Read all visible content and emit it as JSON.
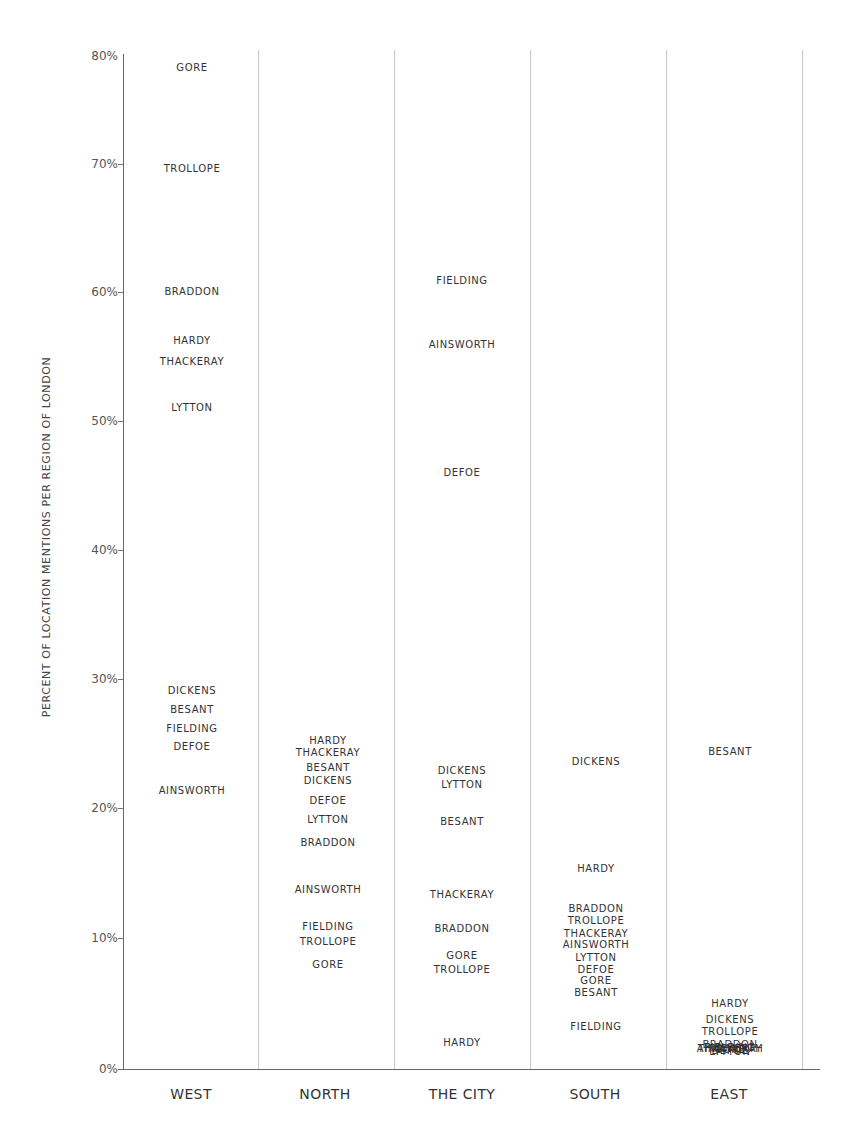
{
  "chart_data": {
    "type": "scatter",
    "title": "",
    "xlabel": "",
    "ylabel": "PERCENT OF LOCATION MENTIONS PER REGION OF LONDON",
    "ylim": [
      0,
      80
    ],
    "yticks": [
      "0%",
      "10%",
      "20%",
      "30%",
      "40%",
      "50%",
      "60%",
      "70%",
      "80%"
    ],
    "grid": "vertical column separators",
    "legend": "none (points are labeled with author names)",
    "categories": [
      "WEST",
      "NORTH",
      "THE CITY",
      "SOUTH",
      "EAST"
    ],
    "series": [
      {
        "name": "GORE",
        "values": [
          77.6,
          8.1,
          8.8,
          6.8,
          1.5
        ]
      },
      {
        "name": "TROLLOPE",
        "values": [
          69.8,
          9.8,
          7.7,
          11.5,
          2.9
        ]
      },
      {
        "name": "BRADDON",
        "values": [
          60.2,
          17.5,
          10.9,
          12.4,
          1.8
        ]
      },
      {
        "name": "HARDY",
        "values": [
          56.4,
          25.4,
          2.0,
          15.5,
          5.0
        ]
      },
      {
        "name": "THACKERAY",
        "values": [
          54.8,
          24.5,
          13.5,
          10.5,
          1.5
        ]
      },
      {
        "name": "LYTTON",
        "values": [
          51.2,
          19.3,
          22.0,
          8.6,
          1.3
        ]
      },
      {
        "name": "DICKENS",
        "values": [
          29.3,
          22.3,
          23.1,
          23.8,
          3.8
        ]
      },
      {
        "name": "BESANT",
        "values": [
          27.8,
          23.3,
          19.1,
          5.9,
          24.6
        ]
      },
      {
        "name": "FIELDING",
        "values": [
          26.4,
          11.0,
          61.1,
          3.3,
          1.6
        ]
      },
      {
        "name": "DEFOE",
        "values": [
          25.0,
          20.8,
          46.2,
          7.7,
          1.4
        ]
      },
      {
        "name": "AINSWORTH",
        "values": [
          21.6,
          13.9,
          56.1,
          9.6,
          1.5
        ]
      }
    ]
  },
  "axis": {
    "ylabel": "PERCENT OF LOCATION MENTIONS PER REGION OF LONDON",
    "yticks": [
      "0%",
      "10%",
      "20%",
      "30%",
      "40%",
      "50%",
      "60%",
      "70%",
      "80%"
    ],
    "categories": [
      "WEST",
      "NORTH",
      "THE CITY",
      "SOUTH",
      "EAST"
    ]
  },
  "labels": {
    "west": [
      {
        "name": "GORE",
        "y": 68
      },
      {
        "name": "TROLLOPE",
        "y": 169
      },
      {
        "name": "BRADDON",
        "y": 292
      },
      {
        "name": "HARDY",
        "y": 341
      },
      {
        "name": "THACKERAY",
        "y": 362
      },
      {
        "name": "LYTTON",
        "y": 408
      },
      {
        "name": "DICKENS",
        "y": 691
      },
      {
        "name": "BESANT",
        "y": 710
      },
      {
        "name": "FIELDING",
        "y": 729
      },
      {
        "name": "DEFOE",
        "y": 747
      },
      {
        "name": "AINSWORTH",
        "y": 791
      }
    ],
    "north": [
      {
        "name": "HARDY",
        "y": 741
      },
      {
        "name": "THACKERAY",
        "y": 753
      },
      {
        "name": "BESANT",
        "y": 768
      },
      {
        "name": "DICKENS",
        "y": 781
      },
      {
        "name": "DEFOE",
        "y": 801
      },
      {
        "name": "LYTTON",
        "y": 820
      },
      {
        "name": "BRADDON",
        "y": 843
      },
      {
        "name": "AINSWORTH",
        "y": 890
      },
      {
        "name": "FIELDING",
        "y": 927
      },
      {
        "name": "TROLLOPE",
        "y": 942
      },
      {
        "name": "GORE",
        "y": 965
      }
    ],
    "city": [
      {
        "name": "FIELDING",
        "y": 281
      },
      {
        "name": "AINSWORTH",
        "y": 345
      },
      {
        "name": "DEFOE",
        "y": 473
      },
      {
        "name": "DICKENS",
        "y": 771
      },
      {
        "name": "LYTTON",
        "y": 785
      },
      {
        "name": "BESANT",
        "y": 822
      },
      {
        "name": "THACKERAY",
        "y": 895
      },
      {
        "name": "BRADDON",
        "y": 929
      },
      {
        "name": "GORE",
        "y": 956
      },
      {
        "name": "TROLLOPE",
        "y": 970
      },
      {
        "name": "HARDY",
        "y": 1043
      }
    ],
    "south": [
      {
        "name": "DICKENS",
        "y": 762
      },
      {
        "name": "HARDY",
        "y": 869
      },
      {
        "name": "BRADDON",
        "y": 909
      },
      {
        "name": "TROLLOPE",
        "y": 921
      },
      {
        "name": "THACKERAY",
        "y": 934
      },
      {
        "name": "AINSWORTH",
        "y": 945
      },
      {
        "name": "LYTTON",
        "y": 958
      },
      {
        "name": "DEFOE",
        "y": 970
      },
      {
        "name": "GORE",
        "y": 981
      },
      {
        "name": "BESANT",
        "y": 993
      },
      {
        "name": "FIELDING",
        "y": 1027
      }
    ],
    "east": [
      {
        "name": "BESANT",
        "y": 752
      },
      {
        "name": "HARDY",
        "y": 1004
      },
      {
        "name": "DICKENS",
        "y": 1020
      },
      {
        "name": "TROLLOPE",
        "y": 1032
      },
      {
        "name": "BRADDON",
        "y": 1045
      },
      {
        "name": "FIELDING",
        "y": 1048
      },
      {
        "name": "AINSWORTH",
        "y": 1049
      },
      {
        "name": "THACKERAY",
        "y": 1049
      },
      {
        "name": "GORE",
        "y": 1050
      },
      {
        "name": "DEFOE",
        "y": 1051
      },
      {
        "name": "LYTTON",
        "y": 1052
      }
    ]
  }
}
